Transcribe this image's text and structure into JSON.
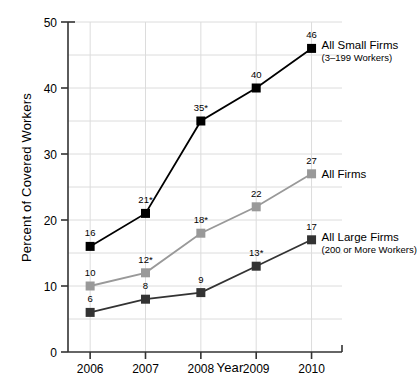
{
  "chart_data": {
    "type": "line",
    "title": "",
    "xlabel": "Year",
    "ylabel": "Percent of Covered Workers",
    "categories": [
      "2006",
      "2007",
      "2008",
      "2009",
      "2010"
    ],
    "x": [
      2006,
      2007,
      2008,
      2009,
      2010
    ],
    "xlim": [
      2005.6,
      2010.55
    ],
    "ylim": [
      0,
      50
    ],
    "yticks": [
      0,
      10,
      20,
      30,
      40,
      50
    ],
    "yticklabels": [
      "0",
      "10",
      "20",
      "30",
      "40",
      "50"
    ],
    "yminorticks": [
      5,
      15,
      25,
      35,
      45
    ],
    "grid": "both",
    "legend_position": "inline-right",
    "annotation_note": "Asterisk (*) indicates estimate is statistically different from previous year shown.",
    "series": [
      {
        "name": "All Small Firms",
        "sublabel": "(3–199 Workers)",
        "color": "#000000",
        "marker": "square",
        "values": [
          16,
          21,
          35,
          40,
          46
        ],
        "point_labels": [
          "16",
          "21*",
          "35*",
          "40",
          "46"
        ]
      },
      {
        "name": "All Firms",
        "sublabel": "",
        "color": "#999999",
        "marker": "square",
        "values": [
          10,
          12,
          18,
          22,
          27
        ],
        "point_labels": [
          "10",
          "12*",
          "18*",
          "22",
          "27"
        ]
      },
      {
        "name": "All Large Firms",
        "sublabel": "(200 or More Workers)",
        "color": "#333333",
        "marker": "square",
        "values": [
          6,
          8,
          9,
          13,
          17
        ],
        "point_labels": [
          "6",
          "8",
          "9",
          "13*",
          "17"
        ]
      }
    ]
  },
  "axes": {
    "x_title": "Year",
    "y_title": "Percent of Covered Workers"
  },
  "colors": {
    "small_firms": "#000000",
    "all_firms": "#999999",
    "large_firms": "#333333",
    "grid": "#dcdcdc",
    "axis": "#333333"
  }
}
